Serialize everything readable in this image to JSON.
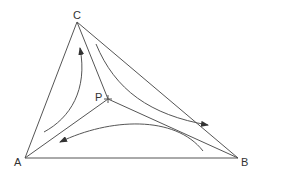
{
  "diagram": {
    "vertices": [
      {
        "id": "A",
        "label": "A"
      },
      {
        "id": "B",
        "label": "B"
      },
      {
        "id": "C",
        "label": "C"
      },
      {
        "id": "P",
        "label": "P"
      }
    ],
    "edges": [
      {
        "from": "A",
        "to": "B"
      },
      {
        "from": "B",
        "to": "C"
      },
      {
        "from": "C",
        "to": "A"
      },
      {
        "from": "P",
        "to": "A"
      },
      {
        "from": "P",
        "to": "B"
      },
      {
        "from": "P",
        "to": "C"
      }
    ],
    "flow_arrows": [
      {
        "region": "APC",
        "direction": "toward C"
      },
      {
        "region": "CPB",
        "direction": "toward B"
      },
      {
        "region": "APB",
        "direction": "toward A"
      }
    ],
    "colors": {
      "stroke": "#555555",
      "text": "#333333"
    }
  }
}
